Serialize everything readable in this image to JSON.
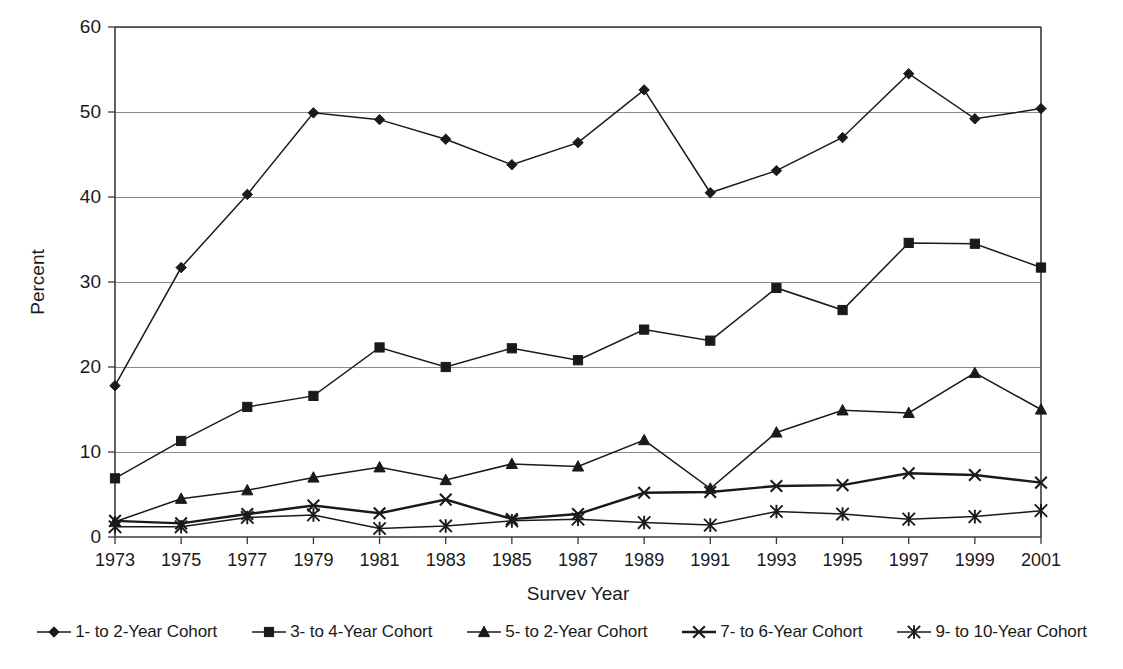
{
  "chart_data": {
    "type": "line",
    "title": "",
    "xlabel": "Survey Year",
    "ylabel": "Percent",
    "xlim": [
      1973,
      2001
    ],
    "ylim": [
      0,
      60
    ],
    "ytick_step": 10,
    "grid": "horizontal",
    "legend_position": "bottom",
    "x": [
      1973,
      1975,
      1977,
      1979,
      1981,
      1983,
      1985,
      1987,
      1989,
      1991,
      1993,
      1995,
      1997,
      1999,
      2001
    ],
    "xtick_labels": [
      "1973",
      "1975",
      "1977",
      "1979",
      "1981",
      "1983",
      "1985",
      "1987",
      "1989",
      "1991",
      "1993",
      "1995",
      "1997",
      "1999",
      "2001"
    ],
    "ytick_labels": [
      "0",
      "10",
      "20",
      "30",
      "40",
      "50",
      "60"
    ],
    "ytick_values": [
      0,
      10,
      20,
      30,
      40,
      50,
      60
    ],
    "series": [
      {
        "name": "1- to 2-Year Cohort",
        "marker": "diamond",
        "values": [
          17.8,
          31.7,
          40.3,
          49.9,
          49.1,
          46.8,
          43.8,
          46.4,
          52.6,
          40.5,
          43.1,
          47.0,
          54.5,
          49.2,
          50.4
        ]
      },
      {
        "name": "3- to 4-Year Cohort",
        "marker": "square",
        "values": [
          6.9,
          11.3,
          15.3,
          16.6,
          22.3,
          20.0,
          22.2,
          20.8,
          24.4,
          23.1,
          29.3,
          26.7,
          34.6,
          34.5,
          31.7
        ]
      },
      {
        "name": "5- to 2-Year Cohort",
        "marker": "triangle",
        "values": [
          1.8,
          4.5,
          5.5,
          7.0,
          8.2,
          6.7,
          8.6,
          8.3,
          11.4,
          5.7,
          12.3,
          14.9,
          14.6,
          19.3,
          15.0
        ]
      },
      {
        "name": "7- to 6-Year Cohort",
        "marker": "cross",
        "values": [
          1.9,
          1.6,
          2.7,
          3.7,
          2.8,
          4.4,
          2.1,
          2.7,
          5.2,
          5.3,
          6.0,
          6.1,
          7.5,
          7.3,
          6.4
        ]
      },
      {
        "name": "9- to 10-Year Cohort",
        "marker": "asterisk",
        "values": [
          1.2,
          1.2,
          2.3,
          2.6,
          1.0,
          1.3,
          1.9,
          2.1,
          1.7,
          1.4,
          3.0,
          2.7,
          2.1,
          2.4,
          3.1
        ]
      }
    ]
  },
  "colors": {
    "ink": "#1a1a1a",
    "grid": "#8a8a8a",
    "background": "#ffffff"
  }
}
